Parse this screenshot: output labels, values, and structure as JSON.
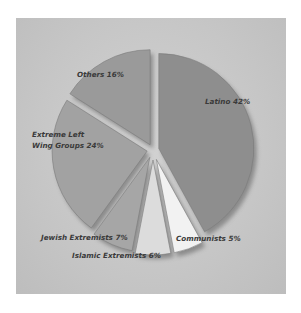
{
  "chart_data": {
    "type": "pie",
    "title": "",
    "exploded": true,
    "categories": [
      "Latino",
      "Communists",
      "Islamic Extremists",
      "Jewish Extremists",
      "Extreme Left Wing Groups",
      "Others"
    ],
    "values": [
      42,
      5,
      6,
      7,
      24,
      16
    ],
    "unit": "%",
    "slices": [
      {
        "name": "Latino",
        "value": 42,
        "label": "Latino 42%",
        "color": "#8e8e8e"
      },
      {
        "name": "Communists",
        "value": 5,
        "label": "Communists 5%",
        "color": "#f2f2f2"
      },
      {
        "name": "Islamic Extremists",
        "value": 6,
        "label": "Islamic Extremists 6%",
        "color": "#dcdcdc"
      },
      {
        "name": "Jewish Extremists",
        "value": 7,
        "label": "Jewish Extremists 7%",
        "color": "#a6a6a6"
      },
      {
        "name": "Extreme Left Wing Groups",
        "value": 24,
        "label_line1": "Extreme Left",
        "label_line2": "Wing Groups 24%",
        "color": "#a2a2a2"
      },
      {
        "name": "Others",
        "value": 16,
        "label": "Others 16%",
        "color": "#9a9a9a"
      }
    ],
    "legend": "none (labels on chart)"
  },
  "colors": {
    "background_panel": "#c9c9c9",
    "page": "#ffffff",
    "label_text": "#3a3a3a",
    "shadow": "#5a5a5a"
  }
}
